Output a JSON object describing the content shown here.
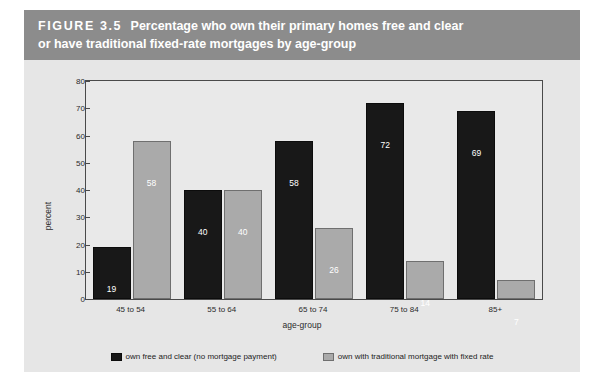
{
  "figure": {
    "label": "FIGURE 3.5",
    "title_line1": "Percentage who own their primary homes free and clear",
    "title_line2": "or have traditional fixed-rate mortgages by age-group",
    "header_bg": "#8c8c8c",
    "panel_bg": "#e6e6e6"
  },
  "chart_data": {
    "type": "bar",
    "title": "Percentage who own their primary homes free and clear or have traditional fixed-rate mortgages by age-group",
    "xlabel": "age-group",
    "ylabel": "percent",
    "ylim": [
      0,
      80
    ],
    "yticks": [
      0,
      10,
      20,
      30,
      40,
      50,
      60,
      70,
      80
    ],
    "grid": false,
    "legend_position": "bottom",
    "categories": [
      "45 to 54",
      "55 to 64",
      "65 to 74",
      "75 to 84",
      "85+"
    ],
    "series": [
      {
        "name": "own free and clear (no mortgage payment)",
        "color": "#181818",
        "values": [
          19,
          40,
          58,
          72,
          69
        ]
      },
      {
        "name": "own with traditional mortgage with fixed rate",
        "color": "#aaaaaa",
        "values": [
          58,
          40,
          26,
          14,
          7
        ]
      }
    ]
  }
}
